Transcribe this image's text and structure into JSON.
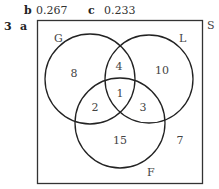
{
  "header": {
    "part_b_label": "b",
    "part_b_value": "0.267",
    "part_c_label": "c",
    "part_c_value": "0.233",
    "question_number": "3",
    "part_a_label": "a"
  },
  "venn": {
    "universal_label": "S",
    "sets": [
      {
        "label": "G"
      },
      {
        "label": "L"
      },
      {
        "label": "F"
      }
    ],
    "regions": {
      "G_only": "8",
      "L_only": "10",
      "F_only": "15",
      "G_L_only": "4",
      "G_F_only": "2",
      "L_F_only": "3",
      "G_L_F": "1",
      "outside": "7"
    }
  }
}
